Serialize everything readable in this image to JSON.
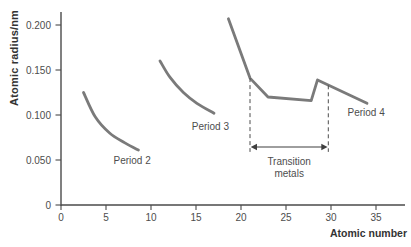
{
  "chart_data": {
    "type": "line",
    "title": "",
    "xlabel": "Atomic number",
    "ylabel": "Atomic radius/nm",
    "xlim": [
      0,
      38.2
    ],
    "ylim": [
      0,
      0.2144
    ],
    "grid": false,
    "legend": "none",
    "x_ticks": [
      0,
      5,
      10,
      15,
      20,
      25,
      30,
      35
    ],
    "x_tick_labels": [
      "0",
      "5",
      "10",
      "15",
      "20",
      "25",
      "30",
      "35"
    ],
    "y_ticks": [
      0,
      0.05,
      0.1,
      0.15,
      0.2
    ],
    "y_tick_labels": [
      "0",
      "0.050",
      "0.100",
      "0.150",
      "0.200"
    ],
    "series": [
      {
        "name": "Period 2",
        "smooth": true,
        "label_x": 7.9,
        "label_y": 0.049,
        "points": [
          [
            2.5,
            0.125
          ],
          [
            3.8,
            0.098
          ],
          [
            5.4,
            0.08
          ],
          [
            7.1,
            0.069
          ],
          [
            8.6,
            0.061
          ]
        ]
      },
      {
        "name": "Period 3",
        "smooth": true,
        "label_x": 16.6,
        "label_y": 0.087,
        "points": [
          [
            11.0,
            0.16
          ],
          [
            12.1,
            0.142
          ],
          [
            13.6,
            0.125
          ],
          [
            15.1,
            0.113
          ],
          [
            17.0,
            0.102
          ]
        ]
      },
      {
        "name": "Period 4",
        "smooth": false,
        "label_x": 33.9,
        "label_y": 0.103,
        "points": [
          [
            18.6,
            0.207
          ],
          [
            21.0,
            0.141
          ],
          [
            23.0,
            0.12
          ],
          [
            27.8,
            0.116
          ],
          [
            28.5,
            0.139
          ],
          [
            34.0,
            0.113
          ]
        ]
      }
    ],
    "annotation": {
      "line1": "Transition",
      "line2": "metals",
      "x_start": 21.0,
      "x_end": 29.7,
      "top_y": [
        0.141,
        0.133
      ],
      "bottom_y": 0.059
    },
    "colors": {
      "curve": "#7a7a7a",
      "axis": "#4a4a4a",
      "tick_text": "#4d4d4d",
      "title_text": "#333333",
      "annotation": "#3f3f3f",
      "background": "#ffffff"
    }
  }
}
